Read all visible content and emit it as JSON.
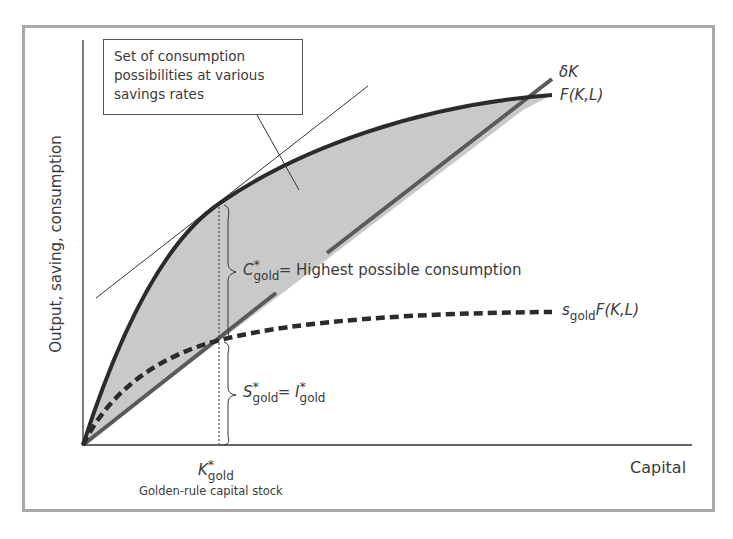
{
  "diagram": {
    "axes": {
      "y_label": "Output, saving, consumption",
      "x_label": "Capital"
    },
    "callout": {
      "text": "Set of consumption possibilities at various savings rates"
    },
    "curves": {
      "depreciation": {
        "label": "δK"
      },
      "production": {
        "label_func": "F",
        "label_args": "(K,L)"
      },
      "saving": {
        "label_s": "s",
        "label_sub": "gold",
        "label_func": "F",
        "label_args": "(K,L)"
      }
    },
    "annotations": {
      "consumption": {
        "var": "C",
        "star": "*",
        "sub": "gold",
        "eq": "=",
        "text": "Highest possible consumption"
      },
      "saving_investment": {
        "var1": "S",
        "star1": "*",
        "sub1": "gold",
        "eq": "=",
        "var2": "I",
        "star2": "*",
        "sub2": "gold"
      },
      "k_gold": {
        "var": "K",
        "star": "*",
        "sub": "gold",
        "caption": "Golden-rule capital stock"
      }
    },
    "colors": {
      "frame": "#a8a8a8",
      "production_curve": "#2b2b2b",
      "depreciation_line": "#555555",
      "shaded_region": "#c8c8c8",
      "saving_curve": "#2b2b2b",
      "text": "#3a3a3a"
    }
  }
}
